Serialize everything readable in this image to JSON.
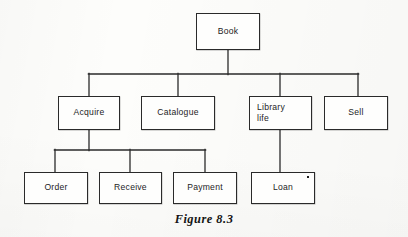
{
  "figure": {
    "caption": "Figure 8.3",
    "type": "hierarchical tree diagram",
    "line_color": "#2a2a2a",
    "box_fill": "#fefefd",
    "text_color": "#1d1d1d",
    "page_background": "#fdfdfb"
  },
  "nodes": {
    "book": {
      "label": "Book",
      "level": 1,
      "x": 196,
      "y": 13,
      "w": 64,
      "h": 37
    },
    "acquire": {
      "label": "Acquire",
      "level": 2,
      "x": 58,
      "y": 96,
      "w": 62,
      "h": 34
    },
    "catalogue": {
      "label": "Catalogue",
      "level": 2,
      "x": 141,
      "y": 96,
      "w": 74,
      "h": 34
    },
    "library_life": {
      "label": "Library\nlife",
      "level": 2,
      "x": 249,
      "y": 96,
      "w": 63,
      "h": 34
    },
    "sell": {
      "label": "Sell",
      "level": 2,
      "x": 324,
      "y": 96,
      "w": 64,
      "h": 34
    },
    "order": {
      "label": "Order",
      "level": 3,
      "x": 24,
      "y": 172,
      "w": 64,
      "h": 32
    },
    "receive": {
      "label": "Receive",
      "level": 3,
      "x": 99,
      "y": 172,
      "w": 63,
      "h": 32
    },
    "payment": {
      "label": "Payment",
      "level": 3,
      "x": 173,
      "y": 172,
      "w": 64,
      "h": 32
    },
    "loan": {
      "label": "Loan",
      "level": 3,
      "x": 251,
      "y": 172,
      "w": 64,
      "h": 32,
      "marker": "*"
    }
  },
  "edges": [
    {
      "from": "book",
      "to": "acquire"
    },
    {
      "from": "book",
      "to": "catalogue"
    },
    {
      "from": "book",
      "to": "library_life"
    },
    {
      "from": "book",
      "to": "sell"
    },
    {
      "from": "acquire",
      "to": "order"
    },
    {
      "from": "acquire",
      "to": "receive"
    },
    {
      "from": "acquire",
      "to": "payment"
    },
    {
      "from": "library_life",
      "to": "loan"
    }
  ],
  "connectors": {
    "root_stem": {
      "x": 228,
      "y1": 50,
      "y2": 74
    },
    "main_bus": {
      "y": 74,
      "x1": 89,
      "x2": 358
    },
    "main_drops": [
      {
        "x": 89,
        "y1": 74,
        "y2": 96
      },
      {
        "x": 178,
        "y1": 74,
        "y2": 96
      },
      {
        "x": 280,
        "y1": 74,
        "y2": 96
      },
      {
        "x": 358,
        "y1": 74,
        "y2": 96
      }
    ],
    "acquire_stem": {
      "x": 89,
      "y1": 130,
      "y2": 150
    },
    "acquire_bus": {
      "y": 150,
      "x1": 55,
      "x2": 205
    },
    "acquire_drops": [
      {
        "x": 55,
        "y1": 150,
        "y2": 172
      },
      {
        "x": 130,
        "y1": 150,
        "y2": 172
      },
      {
        "x": 205,
        "y1": 150,
        "y2": 172
      }
    ],
    "library_stem": {
      "x": 280,
      "y1": 130,
      "y2": 172
    }
  }
}
